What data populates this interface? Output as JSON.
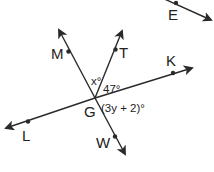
{
  "diagram": {
    "stroke_color": "#2a2a2a",
    "background": "#ffffff",
    "intersection": {
      "label": "G"
    },
    "points": {
      "M": "M",
      "T": "T",
      "K": "K",
      "L": "L",
      "W": "W",
      "E": "E"
    },
    "angles": {
      "x": "x°",
      "given": "47°",
      "expression": "(3y + 2)°"
    },
    "lines": [
      {
        "name": "line-MW",
        "through": [
          "M",
          "G",
          "W"
        ]
      },
      {
        "name": "line-LK",
        "through": [
          "L",
          "G",
          "K"
        ]
      },
      {
        "name": "ray-GT",
        "through": [
          "G",
          "T"
        ]
      },
      {
        "name": "ray-E",
        "through": [
          "E"
        ]
      }
    ]
  }
}
